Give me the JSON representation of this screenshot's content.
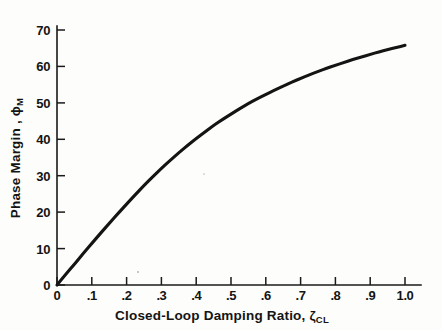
{
  "figure": {
    "background_color": "#fdfdfb",
    "curve_color": "#141414",
    "axis_color": "#1a1a1a"
  },
  "chart_data": {
    "type": "line",
    "title": "",
    "subtitle": "",
    "xlabel": "Closed-Loop Damping Ratio, ζ",
    "xlabel_sub": "CL",
    "ylabel": "Phase Margin , ϕ",
    "ylabel_sub": "M",
    "xlim": [
      0,
      1.0
    ],
    "ylim": [
      0,
      70
    ],
    "grid": false,
    "legend": null,
    "x_tick_labels": [
      "0",
      ".1",
      ".2",
      ".3",
      ".4",
      ".5",
      ".6",
      ".7",
      ".8",
      ".9",
      "1.0"
    ],
    "x_tick_values": [
      0,
      0.1,
      0.2,
      0.3,
      0.4,
      0.5,
      0.6,
      0.7,
      0.8,
      0.9,
      1.0
    ],
    "y_tick_labels": [
      "0",
      "10",
      "20",
      "30",
      "40",
      "50",
      "60",
      "70"
    ],
    "y_tick_values": [
      0,
      10,
      20,
      30,
      40,
      50,
      60,
      70
    ],
    "series": [
      {
        "name": "Phase Margin vs Closed-Loop Damping Ratio",
        "x": [
          0.0,
          0.025,
          0.05,
          0.075,
          0.1,
          0.125,
          0.15,
          0.175,
          0.2,
          0.225,
          0.25,
          0.275,
          0.3,
          0.325,
          0.35,
          0.375,
          0.4,
          0.425,
          0.45,
          0.475,
          0.5,
          0.525,
          0.55,
          0.575,
          0.6,
          0.625,
          0.65,
          0.675,
          0.7,
          0.725,
          0.75,
          0.775,
          0.8,
          0.825,
          0.85,
          0.875,
          0.9,
          0.925,
          0.95,
          0.975,
          1.0
        ],
        "y": [
          0.0,
          2.9,
          5.7,
          8.6,
          11.4,
          14.2,
          16.9,
          19.6,
          22.2,
          24.8,
          27.3,
          29.7,
          32.0,
          34.2,
          36.3,
          38.3,
          40.2,
          42.0,
          43.8,
          45.4,
          46.9,
          48.4,
          49.8,
          51.1,
          52.3,
          53.5,
          54.6,
          55.7,
          56.7,
          57.7,
          58.6,
          59.5,
          60.3,
          61.1,
          61.9,
          62.6,
          63.3,
          64.0,
          64.6,
          65.2,
          65.8
        ]
      }
    ]
  }
}
